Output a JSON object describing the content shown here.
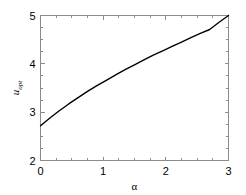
{
  "chart_data": {
    "type": "line",
    "title": "",
    "xlabel": "α",
    "ylabel": "u_opt",
    "ylabel_base": "u",
    "ylabel_sub": "opt",
    "xlim": [
      0,
      3
    ],
    "ylim": [
      2,
      5
    ],
    "grid": false,
    "legend": null,
    "xticks": [
      0,
      1,
      2,
      3
    ],
    "xtick_labels": [
      "0",
      "1",
      "2",
      "3"
    ],
    "yticks": [
      2,
      3,
      4,
      5
    ],
    "ytick_labels": [
      "2",
      "3",
      "4",
      "5"
    ],
    "x_minor_ticks": [
      0.25,
      0.5,
      0.75,
      1.25,
      1.5,
      1.75,
      2.25,
      2.5,
      2.75
    ],
    "y_minor_ticks": [
      2.25,
      2.5,
      2.75,
      3.25,
      3.5,
      3.75,
      4.25,
      4.5,
      4.75
    ],
    "series": [
      {
        "name": "u_opt",
        "color": "#000000",
        "x": [
          0.0,
          0.15,
          0.3,
          0.45,
          0.6,
          0.75,
          0.9,
          1.05,
          1.2,
          1.35,
          1.5,
          1.65,
          1.8,
          1.95,
          2.1,
          2.25,
          2.4,
          2.55,
          2.7,
          2.85,
          3.0
        ],
        "y": [
          2.72,
          2.88,
          3.03,
          3.17,
          3.3,
          3.43,
          3.55,
          3.66,
          3.77,
          3.88,
          3.98,
          4.08,
          4.18,
          4.27,
          4.36,
          4.45,
          4.54,
          4.63,
          4.71,
          4.86,
          5.0
        ]
      }
    ],
    "axis_color": "#8c8c8c",
    "curve_color": "#000000",
    "background_color": "#ffffff"
  },
  "figure": {
    "width": 246,
    "height": 195
  }
}
